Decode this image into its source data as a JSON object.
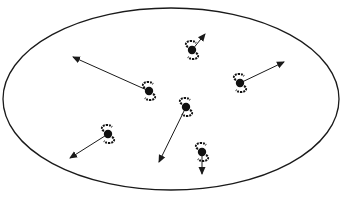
{
  "diagram": {
    "boundary": {
      "shape": "ellipse",
      "cx": 171,
      "cy": 99,
      "rx": 168,
      "ry": 91,
      "stroke": "#1a1a1a"
    },
    "colors": {
      "line": "#1a1a1a",
      "galaxy": "#111111",
      "background": "#ffffff"
    },
    "galaxies": [
      {
        "id": "g1",
        "x": 149,
        "y": 91,
        "arrow_to": [
          73,
          57
        ]
      },
      {
        "id": "g2",
        "x": 192,
        "y": 50,
        "arrow_to": [
          205,
          34
        ]
      },
      {
        "id": "g3",
        "x": 240,
        "y": 83,
        "arrow_to": [
          284,
          62
        ]
      },
      {
        "id": "g4",
        "x": 186,
        "y": 107,
        "arrow_to": [
          159,
          162
        ]
      },
      {
        "id": "g5",
        "x": 108,
        "y": 134,
        "arrow_to": [
          70,
          158
        ]
      },
      {
        "id": "g6",
        "x": 202,
        "y": 152,
        "arrow_to": [
          202,
          174
        ]
      }
    ]
  }
}
